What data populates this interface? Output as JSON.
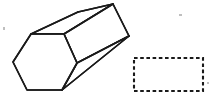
{
  "figure": {
    "title": "Hexagonal prism with empty dashed answer box",
    "background_color": "#ffffff",
    "stroke_color": "#1a1a1a",
    "width": 213,
    "height": 103,
    "shapes": [
      {
        "id": "hexagonal-prism",
        "label": "Hexagonal prism",
        "type": "polyhedron-line-drawing",
        "fill": "#ffffff",
        "stroke": "#1a1a1a",
        "stroke_width": 1.6,
        "front_face": {
          "label": "Front hexagonal face",
          "sides": 6,
          "points": "13,62 31,34 64,34 77,63 62,90 27,90"
        },
        "top_face": {
          "label": "Top rectangular face",
          "points": "31,34 78,12 113,4 64,34"
        },
        "side_face": {
          "label": "Upper right side face",
          "points": "64,34 113,4 129,36 77,63"
        },
        "lower_face": {
          "label": "Lower right side face",
          "points": "77,63 129,36 62,90"
        },
        "back_edges": {
          "label": "Receding back edges",
          "segments": [
            "31,34 78,12",
            "78,12 113,4",
            "113,4 129,36",
            "129,36 77,63",
            "129,36 62,90",
            "64,34 113,4"
          ]
        }
      },
      {
        "id": "dashed-answer-box",
        "label": "Dashed answer box",
        "type": "rectangle",
        "stroke_style": "dashed",
        "stroke": "#1a1a1a",
        "stroke_width": 2.1,
        "dash_pattern": "3.6 2.6",
        "fill": "none",
        "content": "",
        "x": 134,
        "y": 58,
        "width": 69,
        "height": 33
      }
    ],
    "specks": [
      {
        "x": 3,
        "y": 27,
        "w": 2,
        "h": 3
      },
      {
        "x": 179,
        "y": 14,
        "w": 3,
        "h": 2
      },
      {
        "x": 207,
        "y": 82,
        "w": 2,
        "h": 2
      }
    ]
  }
}
